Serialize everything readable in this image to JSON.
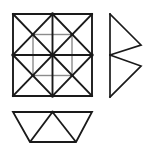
{
  "figure": {
    "background_color": "#ffffff",
    "stroke_color": "#1a1a1a",
    "accent_stroke_color": "#8c8c8c",
    "canvas": {
      "width": 149,
      "height": 151
    },
    "shapes": [
      {
        "id": "square-grid",
        "name": "subdivided-square",
        "description": "Square divided into four quadrants, each quadrant containing an X of diagonals plus short half-cross segments",
        "bounds": {
          "x": 13,
          "y": 14,
          "width": 79,
          "height": 82
        },
        "outline_points": "13,14 92,14 92,96 13,96",
        "lines": [
          {
            "name": "square-outer-top",
            "x1": 13,
            "y1": 14,
            "x2": 92,
            "y2": 14,
            "weight": "heavy"
          },
          {
            "name": "square-outer-right",
            "x1": 92,
            "y1": 14,
            "x2": 92,
            "y2": 96,
            "weight": "heavy"
          },
          {
            "name": "square-outer-bottom",
            "x1": 92,
            "y1": 96,
            "x2": 13,
            "y2": 96,
            "weight": "heavy"
          },
          {
            "name": "square-outer-left",
            "x1": 13,
            "y1": 96,
            "x2": 13,
            "y2": 14,
            "weight": "heavy"
          },
          {
            "name": "square-midline-horizontal",
            "x1": 13,
            "y1": 55,
            "x2": 92,
            "y2": 55,
            "weight": "heavy"
          },
          {
            "name": "square-midline-vertical",
            "x1": 52.5,
            "y1": 14,
            "x2": 52.5,
            "y2": 96,
            "weight": "heavy"
          },
          {
            "name": "quadrant-tl-diagonal-down",
            "x1": 13,
            "y1": 14,
            "x2": 52.5,
            "y2": 55,
            "weight": "heavy"
          },
          {
            "name": "quadrant-tl-diagonal-up",
            "x1": 52.5,
            "y1": 14,
            "x2": 13,
            "y2": 55,
            "weight": "heavy"
          },
          {
            "name": "quadrant-tr-diagonal-down",
            "x1": 52.5,
            "y1": 14,
            "x2": 92,
            "y2": 55,
            "weight": "heavy"
          },
          {
            "name": "quadrant-tr-diagonal-up",
            "x1": 92,
            "y1": 14,
            "x2": 52.5,
            "y2": 55,
            "weight": "heavy"
          },
          {
            "name": "quadrant-bl-diagonal-down",
            "x1": 13,
            "y1": 55,
            "x2": 52.5,
            "y2": 96,
            "weight": "heavy"
          },
          {
            "name": "quadrant-bl-diagonal-up",
            "x1": 52.5,
            "y1": 55,
            "x2": 13,
            "y2": 96,
            "weight": "heavy"
          },
          {
            "name": "quadrant-br-diagonal-down",
            "x1": 52.5,
            "y1": 55,
            "x2": 92,
            "y2": 96,
            "weight": "heavy"
          },
          {
            "name": "quadrant-br-diagonal-up",
            "x1": 92,
            "y1": 55,
            "x2": 52.5,
            "y2": 96,
            "weight": "heavy"
          },
          {
            "name": "quadrant-tl-half-horizontal",
            "x1": 33,
            "y1": 34.5,
            "x2": 52.5,
            "y2": 34.5,
            "weight": "light"
          },
          {
            "name": "quadrant-tl-half-vertical",
            "x1": 33,
            "y1": 34.5,
            "x2": 33,
            "y2": 55,
            "weight": "light"
          },
          {
            "name": "quadrant-tr-half-horizontal",
            "x1": 52.5,
            "y1": 34.5,
            "x2": 72,
            "y2": 34.5,
            "weight": "light"
          },
          {
            "name": "quadrant-tr-half-vertical",
            "x1": 72,
            "y1": 34.5,
            "x2": 72,
            "y2": 55,
            "weight": "light"
          },
          {
            "name": "quadrant-bl-half-vertical",
            "x1": 33,
            "y1": 55,
            "x2": 33,
            "y2": 75.5,
            "weight": "light"
          },
          {
            "name": "quadrant-bl-half-horizontal",
            "x1": 33,
            "y1": 75.5,
            "x2": 52.5,
            "y2": 75.5,
            "weight": "light"
          },
          {
            "name": "quadrant-br-half-vertical",
            "x1": 72,
            "y1": 55,
            "x2": 72,
            "y2": 75.5,
            "weight": "light"
          },
          {
            "name": "quadrant-br-half-horizontal",
            "x1": 52.5,
            "y1": 75.5,
            "x2": 72,
            "y2": 75.5,
            "weight": "light"
          }
        ],
        "vertex_dots": [
          {
            "name": "vertex-center",
            "cx": 52.5,
            "cy": 55
          },
          {
            "name": "vertex-top-mid",
            "cx": 52.5,
            "cy": 14
          },
          {
            "name": "vertex-bottom-mid",
            "cx": 52.5,
            "cy": 96
          },
          {
            "name": "vertex-left-mid",
            "cx": 13,
            "cy": 55
          },
          {
            "name": "vertex-right-mid",
            "cx": 92,
            "cy": 55
          },
          {
            "name": "vertex-quadrant-tl",
            "cx": 33,
            "cy": 34.5
          },
          {
            "name": "vertex-quadrant-tr",
            "cx": 72,
            "cy": 34.5
          },
          {
            "name": "vertex-quadrant-bl",
            "cx": 33,
            "cy": 75.5
          },
          {
            "name": "vertex-quadrant-br",
            "cx": 72,
            "cy": 75.5
          }
        ]
      },
      {
        "id": "right-double-triangle",
        "name": "stacked-right-pointing-triangles",
        "description": "Vertical spine on the left with two right-pointing triangles stacked vertically",
        "bounds": {
          "x": 110,
          "y": 14,
          "width": 31,
          "height": 83
        },
        "lines": [
          {
            "name": "right-shape-spine",
            "x1": 110,
            "y1": 14,
            "x2": 110,
            "y2": 97,
            "weight": "heavy"
          },
          {
            "name": "right-shape-upper-top-edge",
            "x1": 110,
            "y1": 14,
            "x2": 141,
            "y2": 45,
            "weight": "heavy"
          },
          {
            "name": "right-shape-upper-lower-edge",
            "x1": 141,
            "y1": 45,
            "x2": 110,
            "y2": 55,
            "weight": "heavy"
          },
          {
            "name": "right-shape-lower-upper-edge",
            "x1": 110,
            "y1": 55,
            "x2": 141,
            "y2": 66,
            "weight": "heavy"
          },
          {
            "name": "right-shape-lower-bottom-edge",
            "x1": 141,
            "y1": 66,
            "x2": 110,
            "y2": 97,
            "weight": "heavy"
          }
        ],
        "vertex_dots": []
      },
      {
        "id": "bottom-trapezoid",
        "name": "trapezoid-with-inverted-triangle",
        "description": "Isosceles trapezoid, wide side up, subdivided by two lines into three triangles with a downward triangle in the middle",
        "bounds": {
          "x": 13,
          "y": 112,
          "width": 79,
          "height": 30
        },
        "outline_points": "13,112 92,112 76,142 30,142",
        "lines": [
          {
            "name": "trapezoid-top-edge",
            "x1": 13,
            "y1": 112,
            "x2": 92,
            "y2": 112,
            "weight": "heavy"
          },
          {
            "name": "trapezoid-right-edge",
            "x1": 92,
            "y1": 112,
            "x2": 76,
            "y2": 142,
            "weight": "heavy"
          },
          {
            "name": "trapezoid-bottom-edge",
            "x1": 76,
            "y1": 142,
            "x2": 30,
            "y2": 142,
            "weight": "heavy"
          },
          {
            "name": "trapezoid-left-edge",
            "x1": 30,
            "y1": 142,
            "x2": 13,
            "y2": 112,
            "weight": "heavy"
          },
          {
            "name": "trapezoid-inner-left",
            "x1": 52.5,
            "y1": 112,
            "x2": 30,
            "y2": 142,
            "weight": "heavy"
          },
          {
            "name": "trapezoid-inner-right",
            "x1": 52.5,
            "y1": 112,
            "x2": 76,
            "y2": 142,
            "weight": "heavy"
          }
        ],
        "vertex_dots": []
      }
    ]
  }
}
